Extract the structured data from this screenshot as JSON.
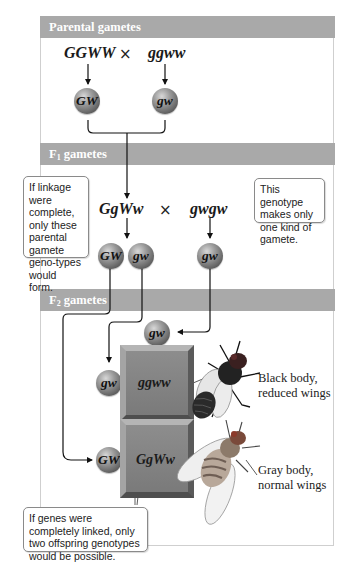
{
  "sections": {
    "parental": {
      "title": "Parental gametes"
    },
    "f1": {
      "title_main": "F",
      "title_sub": "1",
      "title_rest": " gametes"
    },
    "f2": {
      "title_main": "F",
      "title_sub": "2",
      "title_rest": " gametes"
    }
  },
  "parental_cross": {
    "left_genotype": "GGWW",
    "cross_symbol": "×",
    "right_genotype": "ggww",
    "left_gamete": "GW",
    "right_gamete": "gw"
  },
  "f1_cross": {
    "left_genotype": "GgWw",
    "cross_symbol": "×",
    "right_genotype": "gwgw",
    "left_gametes": [
      "GW",
      "gw"
    ],
    "right_gamete": "gw"
  },
  "callouts": {
    "linkage": "If linkage were complete, only these parental gamete geno-types would form.",
    "one_gamete": "This genotype makes only one kind of gamete.",
    "two_genotypes": "If genes were completely linked, only two offspring genotypes would be possible."
  },
  "f2_grid": {
    "top_gamete": "gw",
    "row_gametes": [
      "gw",
      "GW"
    ],
    "offspring": [
      {
        "genotype": "ggww",
        "phenotype_line1": "Black body,",
        "phenotype_line2": "reduced wings"
      },
      {
        "genotype": "GgWw",
        "phenotype_line1": "Gray body,",
        "phenotype_line2": "normal wings"
      }
    ]
  },
  "colors": {
    "header_bar": "#a9a9a9",
    "panel_border": "#cfcfcf",
    "sphere_dark": "#5e5e5e",
    "block_gray": "#858585"
  }
}
